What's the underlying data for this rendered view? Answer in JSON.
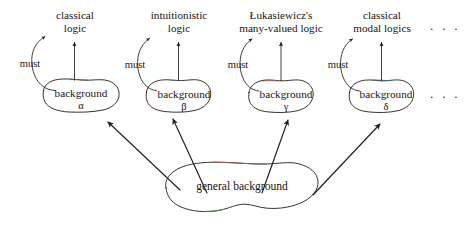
{
  "diagram": {
    "ink_color": "#241c18",
    "branches": [
      {
        "id": "alpha",
        "logic_label_line1": "classical",
        "logic_label_line2": "logic",
        "must_label": "must",
        "node_label": "background",
        "node_symbol": "α"
      },
      {
        "id": "beta",
        "logic_label_line1": "intuitionistic",
        "logic_label_line2": "logic",
        "must_label": "must",
        "node_label": "background",
        "node_symbol": "β"
      },
      {
        "id": "gamma",
        "logic_label_line1": "Łukasiewicz's",
        "logic_label_line2": "many-valued logic",
        "must_label": "must",
        "node_label": "background",
        "node_symbol": "γ"
      },
      {
        "id": "delta",
        "logic_label_line1": "classical",
        "logic_label_line2": "modal logics",
        "must_label": "must",
        "node_label": "background",
        "node_symbol": "δ"
      }
    ],
    "root_node": {
      "label": "general background"
    },
    "ellipsis_top": "· · ·",
    "ellipsis_middle": "· · ·"
  }
}
